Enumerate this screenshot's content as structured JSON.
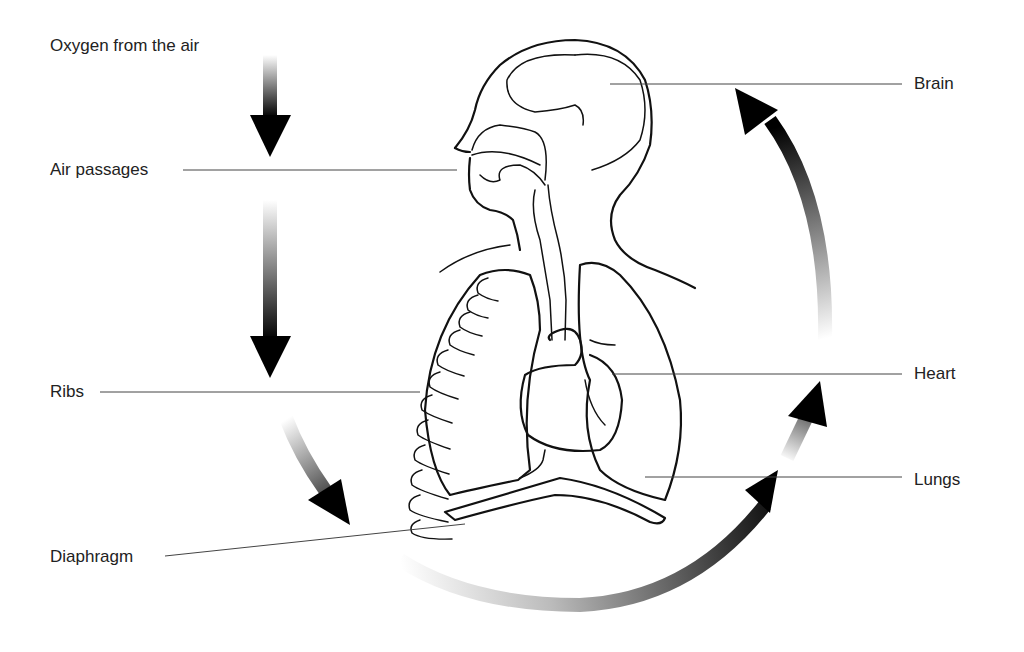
{
  "diagram": {
    "topic": "Oxygen pathway through the respiratory and circulatory system",
    "labels": {
      "oxygen": "Oxygen from the air",
      "air_passages": "Air passages",
      "ribs": "Ribs",
      "diaphragm": "Diaphragm",
      "brain": "Brain",
      "heart": "Heart",
      "lungs": "Lungs"
    },
    "flow_arrows": [
      {
        "id": "air-to-passages",
        "direction": "down",
        "from": "Oxygen from the air",
        "to": "Air passages"
      },
      {
        "id": "passages-to-lungs",
        "direction": "down",
        "from": "Air passages",
        "to": "Ribs / Lungs"
      },
      {
        "id": "lungs-curve",
        "direction": "down-right",
        "from": "Ribs",
        "to": "Diaphragm"
      },
      {
        "id": "bottom-arc",
        "direction": "up-right",
        "from": "Diaphragm",
        "to": "Lungs"
      },
      {
        "id": "lungs-to-heart",
        "direction": "up-right",
        "from": "Lungs",
        "to": "Heart"
      },
      {
        "id": "heart-to-brain",
        "direction": "up",
        "from": "Heart",
        "to": "Brain"
      }
    ],
    "colors": {
      "ink": "#111111",
      "leader": "#444444",
      "background": "#ffffff",
      "arrow_dark": "#000000",
      "arrow_light": "#ffffff"
    }
  }
}
